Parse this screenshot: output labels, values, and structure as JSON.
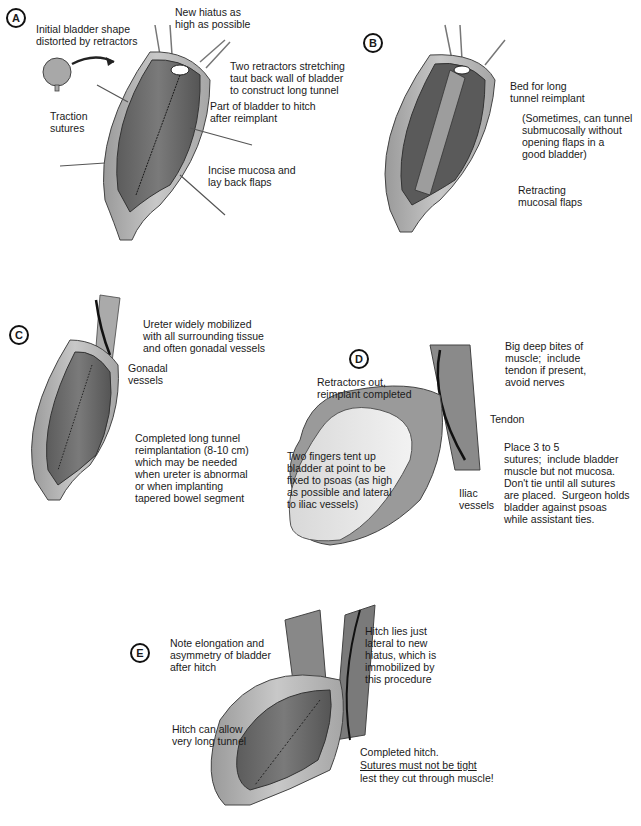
{
  "figure": {
    "panels": [
      {
        "id": "A",
        "labels": {
          "initial_shape": "Initial bladder shape\ndistorted by retractors",
          "new_hiatus": "New hiatus as\nhigh as possible",
          "two_retractors": "Two retractors stretching\ntaut back wall of bladder\nto construct long tunnel",
          "part_to_hitch": "Part of bladder to hitch\nafter reimplant",
          "traction_sutures": "Traction\nsutures",
          "incise_mucosa": "Incise mucosa and\nlay back flaps"
        }
      },
      {
        "id": "B",
        "labels": {
          "bed_for_tunnel": "Bed for long\ntunnel reimplant",
          "sometimes_note": "(Sometimes, can tunnel\nsubmucosally without\nopening flaps in a\ngood bladder)",
          "retracting_flaps": "Retracting\nmucosal flaps"
        }
      },
      {
        "id": "C",
        "labels": {
          "ureter_mobilized": "Ureter widely mobilized\nwith all surrounding tissue\nand often gonadal vessels",
          "gonadal_vessels": "Gonadal\nvessels",
          "completed_tunnel": "Completed long tunnel\nreimplantation (8-10 cm)\nwhich may be needed\nwhen ureter is abnormal\nor when implanting\ntapered bowel segment"
        }
      },
      {
        "id": "D",
        "labels": {
          "retractors_out": "Retractors out,\nreimplant completed",
          "big_deep_bites": "Big deep bites of\nmuscle;  include\ntendon if present,\navoid nerves",
          "tendon": "Tendon",
          "two_fingers": "Two fingers tent up\nbladder at point to be\nfixed to psoas (as high\nas possible and lateral\nto iliac vessels)",
          "iliac_vessels": "Iliac\nvessels",
          "place_sutures": "Place 3 to 5\nsutures;  include bladder\nmuscle but not mucosa.\nDon't tie until all sutures\nare placed.  Surgeon holds\nbladder against psoas\nwhile assistant ties."
        }
      },
      {
        "id": "E",
        "labels": {
          "note_elongation": "Note elongation and\nasymmetry of bladder\nafter hitch",
          "hitch_lies": "Hitch lies just\nlateral to new\nhiatus, which is\nimmobilized by\nthis procedure",
          "hitch_allows": "Hitch can allow\nvery long tunnel",
          "completed_hitch": "Completed hitch.",
          "warning": "Sutures must not be tight",
          "warning_cont": "lest they cut through muscle!"
        }
      }
    ]
  }
}
